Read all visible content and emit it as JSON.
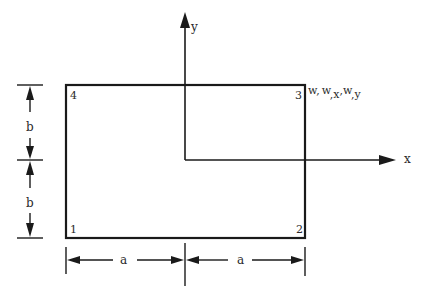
{
  "diagram": {
    "axes": {
      "x_label": "x",
      "y_label": "y"
    },
    "nodes": [
      {
        "id": "1",
        "position": "bottom-left"
      },
      {
        "id": "2",
        "position": "bottom-right"
      },
      {
        "id": "3",
        "position": "top-right"
      },
      {
        "id": "4",
        "position": "top-left"
      }
    ],
    "node3_dof": {
      "w1": "w",
      "sep1": ",",
      "w2": "w",
      "sub2": ",x",
      "sep2": ",",
      "w3": "w",
      "sub3": ",y"
    },
    "dimensions": {
      "vertical": [
        "b",
        "b"
      ],
      "horizontal": [
        "a",
        "a"
      ]
    },
    "colors": {
      "line": "#1a1a1a",
      "text": "#2a2a2a",
      "background": "#ffffff"
    }
  }
}
